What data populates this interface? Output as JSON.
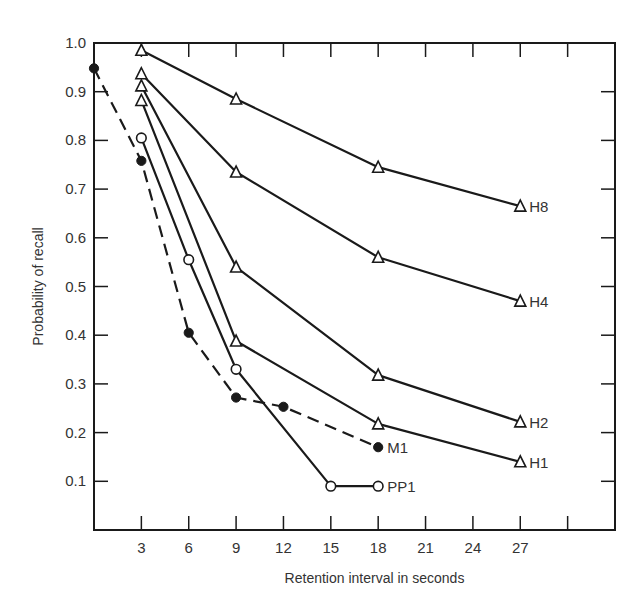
{
  "chart_data": {
    "type": "line",
    "title": "",
    "xlabel": "Retention interval in seconds",
    "ylabel": "Probability of recall",
    "xlim": [
      0,
      33
    ],
    "ylim": [
      0,
      1.0
    ],
    "grid": false,
    "legend": "inline labels at line ends",
    "xticks": [
      3,
      6,
      9,
      12,
      15,
      18,
      21,
      24,
      27,
      30
    ],
    "xtick_labels": [
      "3",
      "6",
      "9",
      "12",
      "15",
      "18",
      "21",
      "24",
      "27",
      ""
    ],
    "yticks": [
      0.1,
      0.2,
      0.3,
      0.4,
      0.5,
      0.6,
      0.7,
      0.8,
      0.9,
      1.0
    ],
    "ytick_labels": [
      "0.1",
      "0.2",
      "0.3",
      "0.4",
      "0.5",
      "0.6",
      "0.7",
      "0.8",
      "0.9",
      "1.0"
    ],
    "series": [
      {
        "name": "H8",
        "marker": "open-triangle",
        "line": "solid",
        "x": [
          3,
          9,
          18,
          27
        ],
        "values": [
          0.985,
          0.885,
          0.745,
          0.665
        ]
      },
      {
        "name": "H4",
        "marker": "open-triangle",
        "line": "solid",
        "x": [
          3,
          9,
          18,
          27
        ],
        "values": [
          0.937,
          0.735,
          0.56,
          0.47
        ]
      },
      {
        "name": "H2",
        "marker": "open-triangle",
        "line": "solid",
        "x": [
          3,
          9,
          18,
          27
        ],
        "values": [
          0.912,
          0.54,
          0.318,
          0.222
        ]
      },
      {
        "name": "H1",
        "marker": "open-triangle",
        "line": "solid",
        "x": [
          3,
          9,
          18,
          27
        ],
        "values": [
          0.882,
          0.388,
          0.218,
          0.14
        ]
      },
      {
        "name": "PP1",
        "marker": "open-circle",
        "line": "solid",
        "x": [
          3,
          6,
          9,
          15,
          18
        ],
        "values": [
          0.805,
          0.555,
          0.33,
          0.09,
          0.09
        ]
      },
      {
        "name": "M1",
        "marker": "filled-circle",
        "line": "dashed",
        "x": [
          0,
          3,
          6,
          9,
          12,
          18
        ],
        "values": [
          0.948,
          0.758,
          0.405,
          0.272,
          0.253,
          0.17
        ]
      }
    ]
  },
  "colors": {
    "ink": "#1a1a1a",
    "text": "#333333",
    "background": "#ffffff"
  }
}
